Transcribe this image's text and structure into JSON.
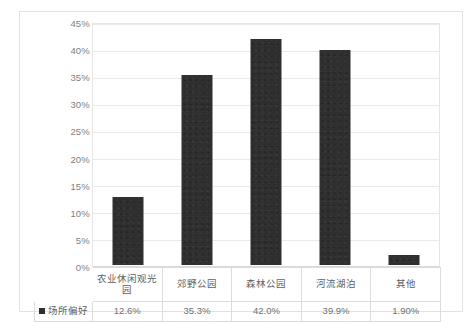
{
  "chart_data": {
    "type": "bar",
    "title": "",
    "subtitle": "",
    "xlabel": "",
    "ylabel": "",
    "categories": [
      "农业休闲观光园",
      "郊野公园",
      "森林公园",
      "河流湖泊",
      "其他"
    ],
    "series": [
      {
        "name": "场所偏好",
        "values": [
          12.6,
          35.3,
          42.0,
          39.9,
          1.9
        ],
        "value_labels": [
          "12.6%",
          "35.3%",
          "42.0%",
          "39.9%",
          "1.90%"
        ],
        "color": "#2f2f2f"
      }
    ],
    "ylim": [
      0,
      45
    ],
    "ytick_step": 5,
    "ytick_labels": [
      "45%",
      "40%",
      "35%",
      "30%",
      "25%",
      "20%",
      "15%",
      "10%",
      "5%",
      "0%"
    ],
    "ytick_values": [
      45,
      40,
      35,
      30,
      25,
      20,
      15,
      10,
      5,
      0
    ],
    "grid": true,
    "legend_position": "data-table-row-header",
    "has_data_table": true
  },
  "legend": {
    "swatch_color": "#2f2f2f",
    "label": "场所偏好"
  },
  "table": {
    "category_row": [
      "农业休闲观光园",
      "郊野公园",
      "森林公园",
      "河流湖泊",
      "其他"
    ],
    "value_row": [
      "12.6%",
      "35.3%",
      "42.0%",
      "39.9%",
      "1.90%"
    ]
  },
  "colors": {
    "bar": "#2f2f2f",
    "gridline": "#e9e9e9",
    "frame_border": "#e2e2e2",
    "table_border": "#dcdcdc",
    "tick_text": "#808080",
    "table_text": "#6f6f6f",
    "background": "#ffffff"
  }
}
